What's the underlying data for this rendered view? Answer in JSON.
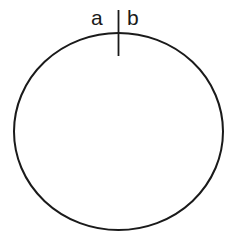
{
  "diagram": {
    "labels": {
      "left": "a",
      "right": "b"
    },
    "stroke_color": "#1a1a1a",
    "background": "#ffffff"
  }
}
